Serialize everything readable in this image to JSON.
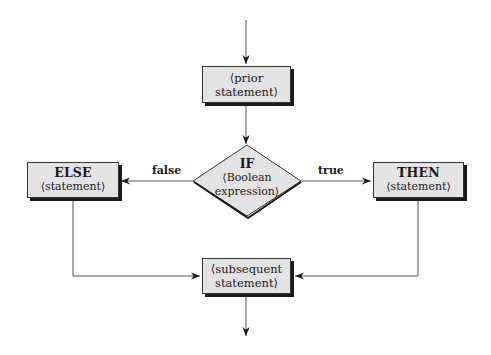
{
  "diagram": {
    "type": "flowchart",
    "nodes": {
      "prior": {
        "line1": "⟨prior",
        "line2": "statement⟩"
      },
      "if": {
        "keyword": "IF",
        "line1": "⟨Boolean",
        "line2": "expression⟩"
      },
      "else": {
        "keyword": "ELSE",
        "line1": "⟨statement⟩"
      },
      "then": {
        "keyword": "THEN",
        "line1": "⟨statement⟩"
      },
      "subsequent": {
        "line1": "⟨subsequent",
        "line2": "statement⟩"
      }
    },
    "edges": {
      "false_label": "false",
      "true_label": "true"
    },
    "colors": {
      "box_fill": "#e3e3e3",
      "stroke": "#333333",
      "shadow": "#1a1a1a"
    }
  }
}
